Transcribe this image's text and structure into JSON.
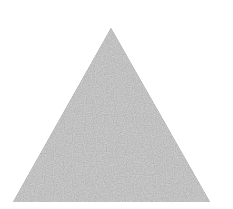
{
  "shape": {
    "type": "triangle",
    "label": "gray triangle",
    "points": [
      [
        111,
        28
      ],
      [
        210,
        202
      ],
      [
        13,
        202
      ]
    ],
    "fill_color": "#8a8a8a",
    "background_color": "#ffffff"
  }
}
